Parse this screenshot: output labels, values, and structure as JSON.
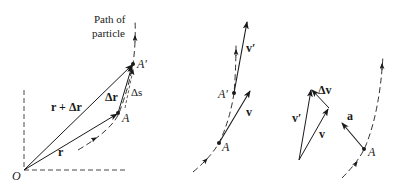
{
  "figure": {
    "panels": [
      {
        "id": "position",
        "labels": {
          "path": "Path of particle",
          "path_line1": "Path of",
          "path_line2": "particle",
          "r_plus_dr": "r + Δr",
          "r": "r",
          "dr": "Δr",
          "ds": "Δs",
          "A": "A",
          "A_prime": "A′",
          "O": "O"
        }
      },
      {
        "id": "velocity",
        "labels": {
          "v_prime": "v′",
          "v": "v",
          "A": "A",
          "A_prime": "A′"
        }
      },
      {
        "id": "velocity-triangle",
        "labels": {
          "dv": "Δv",
          "v_prime": "v′",
          "v": "v"
        }
      },
      {
        "id": "acceleration",
        "labels": {
          "a": "a",
          "A": "A"
        }
      }
    ],
    "colors": {
      "ink": "#1a1a1a",
      "background": "#ffffff"
    }
  }
}
